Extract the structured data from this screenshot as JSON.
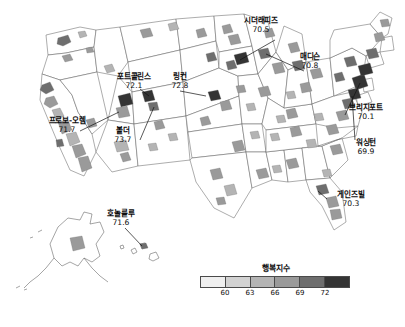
{
  "figure": {
    "type": "choropleth-map",
    "region": "United States",
    "background_color": "#ffffff"
  },
  "legend": {
    "title": "행복지수",
    "tick_labels": [
      "60",
      "63",
      "66",
      "69",
      "72"
    ],
    "tick_positions_pct": [
      16.666,
      33.333,
      50,
      66.666,
      83.333
    ],
    "swatch_colors": [
      "#efefef",
      "#d2d2d2",
      "#b4b4b4",
      "#9a9a9a",
      "#6e6e6e",
      "#343434"
    ],
    "border_color": "#4a4a4a"
  },
  "callouts": [
    {
      "name": "시더래피즈",
      "value": "70.5"
    },
    {
      "name": "매디슨",
      "value": "70.8"
    },
    {
      "name": "포트콜린스",
      "value": "72.1"
    },
    {
      "name": "링컨",
      "value": "72.8"
    },
    {
      "name": "프로보-오렘",
      "value": "71.7"
    },
    {
      "name": "볼더",
      "value": "73.7"
    },
    {
      "name": "브리지포트",
      "value": "70.1"
    },
    {
      "name": "워싱턴",
      "value": "69.9"
    },
    {
      "name": "게인즈빌",
      "value": "70.3"
    },
    {
      "name": "호놀룰루",
      "value": "71.6"
    }
  ],
  "chart_data": {
    "type": "heatmap",
    "title": "행복지수",
    "xlabel": "",
    "ylabel": "",
    "legend_position": "bottom-center",
    "grid": false,
    "value_range": [
      57,
      75
    ],
    "color_scale_breaks": [
      60,
      63,
      66,
      69,
      72
    ],
    "color_scale_colors": [
      "#efefef",
      "#d2d2d2",
      "#b4b4b4",
      "#9a9a9a",
      "#6e6e6e",
      "#343434"
    ],
    "categories": [
      "시더래피즈",
      "매디슨",
      "포트콜린스",
      "링컨",
      "프로보-오렘",
      "볼더",
      "브리지포트",
      "워싱턴",
      "게인즈빌",
      "호놀룰루"
    ],
    "values": [
      70.5,
      70.8,
      72.1,
      72.8,
      71.7,
      73.7,
      70.1,
      69.9,
      70.3,
      71.6
    ],
    "series": [
      {
        "name": "행복지수",
        "values": [
          70.5,
          70.8,
          72.1,
          72.8,
          71.7,
          73.7,
          70.1,
          69.9,
          70.3,
          71.6
        ]
      }
    ]
  }
}
